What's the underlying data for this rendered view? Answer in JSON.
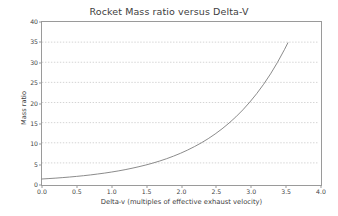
{
  "chart_data": {
    "type": "line",
    "title": "Rocket Mass ratio versus Delta-V",
    "xlabel": "Delta-v (multiples of effective exhaust velocity)",
    "ylabel": "Mass ratio",
    "xlim": [
      0.0,
      4.0
    ],
    "ylim": [
      0,
      40
    ],
    "xticks": [
      "0.0",
      "0.5",
      "1.0",
      "1.5",
      "2.0",
      "2.5",
      "3.0",
      "3.5",
      "4.0"
    ],
    "xtick_values": [
      0.0,
      0.5,
      1.0,
      1.5,
      2.0,
      2.5,
      3.0,
      3.5,
      4.0
    ],
    "yticks": [
      "0",
      "5",
      "10",
      "15",
      "20",
      "25",
      "30",
      "35",
      "40"
    ],
    "ytick_values": [
      0,
      5,
      10,
      15,
      20,
      25,
      30,
      35,
      40
    ],
    "grid": "horizontal-dotted",
    "legend": "none",
    "line_color": "#7d7d7d",
    "axes_color": "#9a9a9a",
    "grid_color": "#c8c8c8",
    "background": "#ffffff",
    "equation": "mass ratio = exp(delta-v / effective exhaust velocity)",
    "series": [
      {
        "name": "Mass ratio",
        "x": [
          0.0,
          0.1,
          0.2,
          0.3,
          0.4,
          0.5,
          0.6,
          0.7,
          0.8,
          0.9,
          1.0,
          1.1,
          1.2,
          1.3,
          1.4,
          1.5,
          1.6,
          1.7,
          1.8,
          1.9,
          2.0,
          2.1,
          2.2,
          2.3,
          2.4,
          2.5,
          2.6,
          2.7,
          2.8,
          2.9,
          3.0,
          3.1,
          3.2,
          3.3,
          3.4,
          3.5,
          3.55
        ],
        "values": [
          1.0,
          1.11,
          1.22,
          1.35,
          1.49,
          1.65,
          1.82,
          2.01,
          2.23,
          2.46,
          2.72,
          3.0,
          3.32,
          3.67,
          4.06,
          4.48,
          4.95,
          5.47,
          6.05,
          6.69,
          7.39,
          8.17,
          9.03,
          9.97,
          11.02,
          12.18,
          13.46,
          14.88,
          16.44,
          18.17,
          20.09,
          22.2,
          24.53,
          27.11,
          29.96,
          33.12,
          34.81
        ]
      }
    ]
  }
}
